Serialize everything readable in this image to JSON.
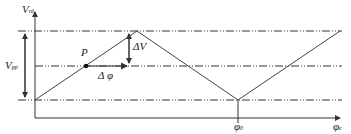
{
  "diagram": {
    "type": "triangular-wave-phase-diagram",
    "labels": {
      "y_axis": "V",
      "y_axis_sub": "rd",
      "x_axis": "φ",
      "x_axis_sub": "e",
      "amplitude": "V",
      "amplitude_sub": "pp",
      "point": "P",
      "delta_v": "ΔV",
      "delta_phi": "Δ φ",
      "phi0": "φ",
      "phi0_sub": "0"
    },
    "colors": {
      "line": "#333333",
      "text": "#222222"
    }
  }
}
